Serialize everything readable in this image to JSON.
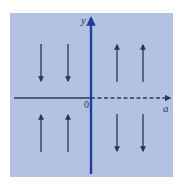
{
  "diagram": {
    "type": "phase-portrait",
    "colors": {
      "background_panel": "#b3c2e3",
      "y_axis": "#1e3f9a",
      "a_axis": "#2e3a5a",
      "arrows": "#2a3350"
    },
    "axes": {
      "vertical": {
        "label": "y"
      },
      "horizontal": {
        "label": "a",
        "left_style": "solid",
        "right_style": "dashed"
      },
      "origin_label": "0"
    },
    "quadrants": [
      {
        "name": "upper-left",
        "arrow_direction": "down",
        "arrow_count": 2
      },
      {
        "name": "upper-right",
        "arrow_direction": "up",
        "arrow_count": 2
      },
      {
        "name": "lower-left",
        "arrow_direction": "up",
        "arrow_count": 2
      },
      {
        "name": "lower-right",
        "arrow_direction": "down",
        "arrow_count": 2
      }
    ]
  }
}
